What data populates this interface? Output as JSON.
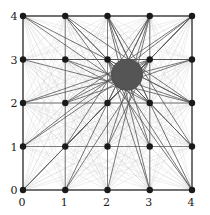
{
  "figure": {
    "title": "",
    "background_color": "#ffffff"
  },
  "chart_data": {
    "type": "scatter",
    "title": "",
    "xlabel": "",
    "ylabel": "",
    "xlim": [
      0,
      4
    ],
    "ylim": [
      0,
      4
    ],
    "grid": true,
    "legend": null,
    "x_ticks": [
      0,
      1,
      2,
      3,
      4
    ],
    "y_ticks": [
      0,
      1,
      2,
      3,
      4
    ],
    "x_tick_labels": [
      "0",
      "1",
      "2",
      "3",
      "4"
    ],
    "y_tick_labels": [
      "0",
      "1",
      "2",
      "3",
      "4"
    ],
    "lattice_points": [
      {
        "x": 0,
        "y": 0
      },
      {
        "x": 1,
        "y": 0
      },
      {
        "x": 2,
        "y": 0
      },
      {
        "x": 3,
        "y": 0
      },
      {
        "x": 4,
        "y": 0
      },
      {
        "x": 0,
        "y": 1
      },
      {
        "x": 1,
        "y": 1
      },
      {
        "x": 2,
        "y": 1
      },
      {
        "x": 3,
        "y": 1
      },
      {
        "x": 4,
        "y": 1
      },
      {
        "x": 0,
        "y": 2
      },
      {
        "x": 1,
        "y": 2
      },
      {
        "x": 2,
        "y": 2
      },
      {
        "x": 3,
        "y": 2
      },
      {
        "x": 4,
        "y": 2
      },
      {
        "x": 0,
        "y": 3
      },
      {
        "x": 1,
        "y": 3
      },
      {
        "x": 2,
        "y": 3
      },
      {
        "x": 3,
        "y": 3
      },
      {
        "x": 4,
        "y": 3
      },
      {
        "x": 0,
        "y": 4
      },
      {
        "x": 1,
        "y": 4
      },
      {
        "x": 2,
        "y": 4
      },
      {
        "x": 3,
        "y": 4
      },
      {
        "x": 4,
        "y": 4
      }
    ],
    "marker": {
      "shape": "circle",
      "color": "#1a1a1a",
      "radius_px": 3.2
    },
    "segments": {
      "description": "All chords between every pair of lattice points",
      "light_color": "#d8d8d8",
      "light_width": 0.45,
      "highlight_color": "#555555",
      "highlight_width": 0.8,
      "highlight_rule": "segments intersecting the disk are drawn darker"
    },
    "disk": {
      "center_x": 2.46,
      "center_y": 2.65,
      "radius": 0.37,
      "color": "#555555",
      "edge_color": "#4a4a4a"
    },
    "border": {
      "color": "#333333",
      "width": 1.0
    },
    "gridline_color": "#555555",
    "gridline_width": 0.7
  }
}
